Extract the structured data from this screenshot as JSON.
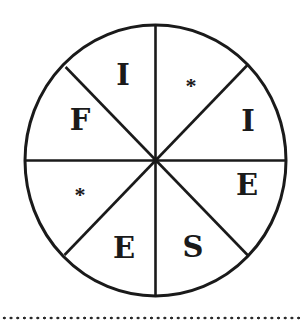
{
  "puzzle": {
    "type": "letter-wheel",
    "segments_count": 8,
    "reading_note": "Segments listed clockwise starting from top-right",
    "segments": [
      {
        "position": "top-right",
        "label": "*",
        "kind": "missing"
      },
      {
        "position": "right-upper",
        "label": "I",
        "kind": "letter"
      },
      {
        "position": "right-lower",
        "label": "E",
        "kind": "letter"
      },
      {
        "position": "bottom-right",
        "label": "S",
        "kind": "letter"
      },
      {
        "position": "bottom-left",
        "label": "E",
        "kind": "letter"
      },
      {
        "position": "left-lower",
        "label": "*",
        "kind": "missing"
      },
      {
        "position": "left-upper",
        "label": "F",
        "kind": "letter"
      },
      {
        "position": "top-left",
        "label": "I",
        "kind": "letter"
      }
    ]
  },
  "colors": {
    "stroke": "#1a1a1a",
    "background": "#ffffff"
  }
}
